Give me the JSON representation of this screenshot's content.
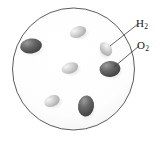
{
  "figure": {
    "background_color": "#ffffff"
  },
  "container": {
    "name": "reaction vessel",
    "shape": "circle",
    "center_x": 73.5,
    "center_y": 69,
    "radius_x": 61,
    "radius_y": 61,
    "stroke_color": "#4a4a4a",
    "fill_color": "#fefefe"
  },
  "labels": {
    "h2": {
      "formula": "H",
      "subscript": "2"
    },
    "o2": {
      "formula": "O",
      "subscript": "2"
    }
  },
  "legend_colors": {
    "hydrogen_fill": "#bdbdbd",
    "hydrogen_highlight": "#efefef",
    "oxygen_fill": "#4f4f4f",
    "oxygen_highlight": "#8d8d8d",
    "leader_line": "#3a3a3a",
    "shadow": "#cfcfcf"
  },
  "molecules": [
    {
      "species": "O2",
      "cx": 31,
      "cy": 46,
      "rx": 11,
      "ry": 7.5,
      "rot": -8
    },
    {
      "species": "H2",
      "cx": 78,
      "cy": 32,
      "rx": 8.5,
      "ry": 5.5,
      "rot": -22
    },
    {
      "species": "H2",
      "cx": 70,
      "cy": 68,
      "rx": 8.5,
      "ry": 5.5,
      "rot": -18
    },
    {
      "species": "H2",
      "cx": 52,
      "cy": 101,
      "rx": 8,
      "ry": 5.5,
      "rot": -25
    },
    {
      "species": "O2",
      "cx": 86,
      "cy": 106,
      "rx": 8,
      "ry": 10.5,
      "rot": 8
    },
    {
      "species": "H2",
      "cx": 106,
      "cy": 49,
      "rx": 7.5,
      "ry": 5.5,
      "rot": 55
    },
    {
      "species": "O2",
      "cx": 110,
      "cy": 69,
      "rx": 10.5,
      "ry": 8,
      "rot": -5
    }
  ],
  "leader_lines": [
    {
      "target": "H2",
      "x1": 110,
      "y1": 46,
      "x2": 138,
      "y2": 24
    },
    {
      "target": "O2",
      "x1": 114,
      "y1": 67,
      "x2": 139,
      "y2": 46
    }
  ]
}
